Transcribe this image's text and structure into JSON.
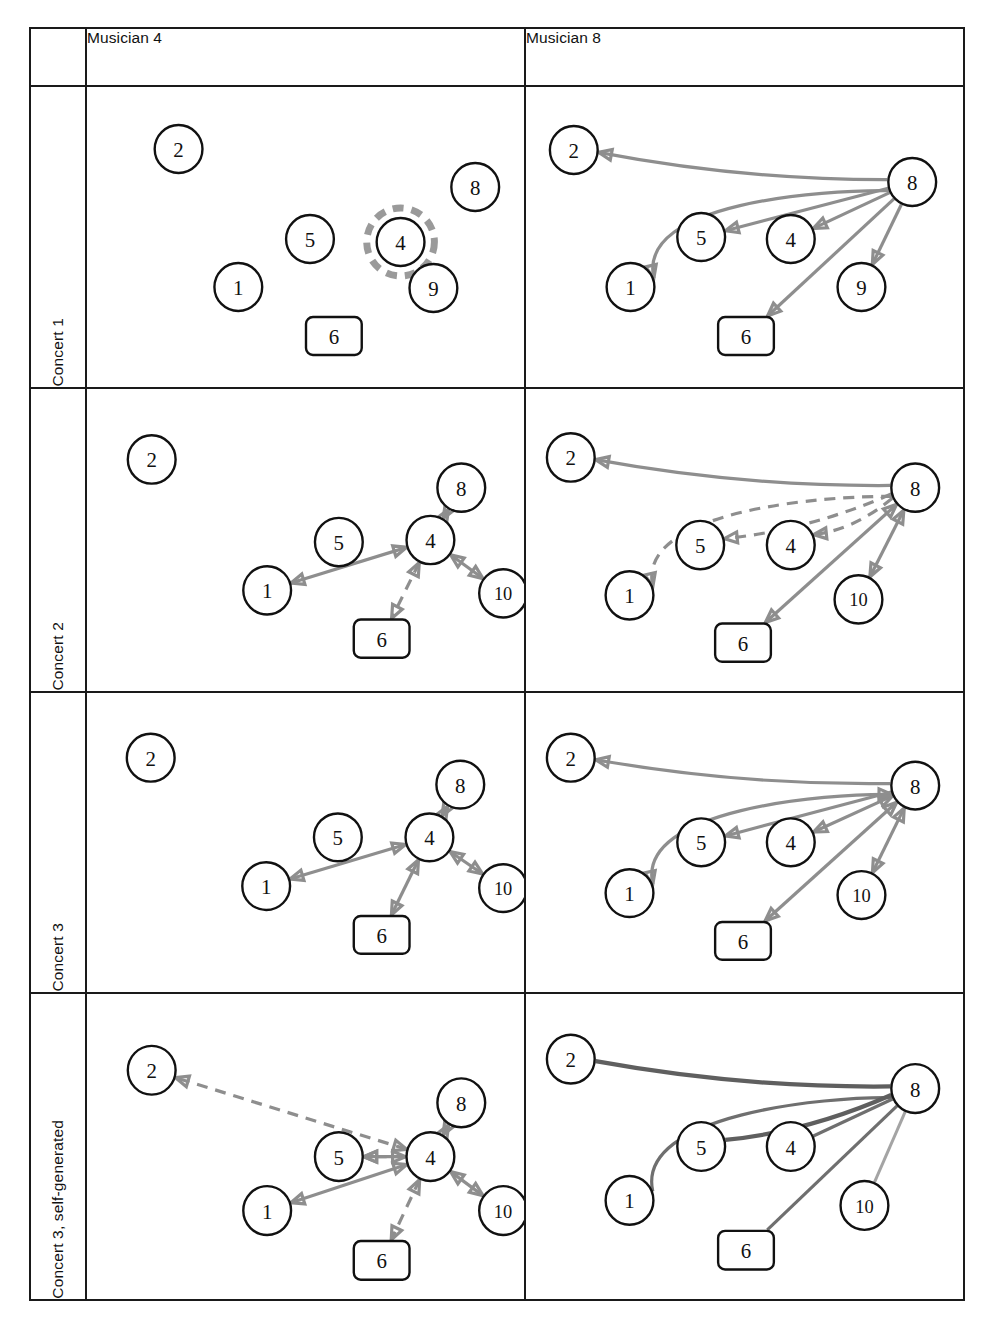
{
  "figure": {
    "columns": [
      {
        "id": "musician4",
        "label": "Musician 4"
      },
      {
        "id": "musician8",
        "label": "Musician 8"
      }
    ],
    "rows": [
      {
        "id": "concert1",
        "label": "Concert 1"
      },
      {
        "id": "concert2",
        "label": "Concert 2"
      },
      {
        "id": "concert3",
        "label": "Concert 3"
      },
      {
        "id": "concert3sg",
        "label": "Concert 3, self-generated"
      }
    ],
    "corner_label": "",
    "colors": {
      "border": "#1a1a1a",
      "node_stroke": "#111111",
      "node_fill": "#ffffff",
      "edge": "#8e8e8e",
      "edge_dark": "#5f5f5f",
      "highlight_ring": "#9a9a9a",
      "background": "#ffffff"
    }
  },
  "chart_data": {
    "type": "diagram",
    "subtype": "directed-graph-matrix",
    "grid": {
      "rows": 4,
      "columns": 2
    },
    "node_shapes": {
      "circle": "musician",
      "rounded-rect": "musician-6"
    },
    "edge_styles": {
      "solid": "observed / realised interaction",
      "dashed": "alternate / secondary interaction",
      "arrow-single": "one-directional",
      "arrow-double": "bi-directional",
      "no-arrow": "undirected link"
    },
    "panels": [
      {
        "row": "Concert 1",
        "column": "Musician 4",
        "focus_node": "4",
        "focus_highlighted": true,
        "nodes": [
          {
            "id": "2",
            "label": "2",
            "shape": "circle",
            "x": 92,
            "y": 62
          },
          {
            "id": "8",
            "label": "8",
            "shape": "circle",
            "x": 390,
            "y": 100
          },
          {
            "id": "5",
            "label": "5",
            "shape": "circle",
            "x": 224,
            "y": 152
          },
          {
            "id": "4",
            "label": "4",
            "shape": "circle",
            "x": 315,
            "y": 155
          },
          {
            "id": "1",
            "label": "1",
            "shape": "circle",
            "x": 152,
            "y": 200
          },
          {
            "id": "9",
            "label": "9",
            "shape": "circle",
            "x": 348,
            "y": 201
          },
          {
            "id": "6",
            "label": "6",
            "shape": "rect",
            "x": 248,
            "y": 249
          }
        ],
        "edges": []
      },
      {
        "row": "Concert 1",
        "column": "Musician 8",
        "focus_node": "8",
        "focus_highlighted": false,
        "nodes": [
          {
            "id": "2",
            "label": "2",
            "shape": "circle",
            "x": 48,
            "y": 63
          },
          {
            "id": "8",
            "label": "8",
            "shape": "circle",
            "x": 388,
            "y": 95
          },
          {
            "id": "5",
            "label": "5",
            "shape": "circle",
            "x": 176,
            "y": 150
          },
          {
            "id": "4",
            "label": "4",
            "shape": "circle",
            "x": 266,
            "y": 152
          },
          {
            "id": "1",
            "label": "1",
            "shape": "circle",
            "x": 105,
            "y": 200
          },
          {
            "id": "9",
            "label": "9",
            "shape": "circle",
            "x": 337,
            "y": 200
          },
          {
            "id": "6",
            "label": "6",
            "shape": "rect",
            "x": 221,
            "y": 249
          }
        ],
        "edges": [
          {
            "from": "8",
            "to": "2",
            "style": "solid",
            "direction": "single",
            "curve": "slight"
          },
          {
            "from": "8",
            "to": "1",
            "style": "solid",
            "direction": "single",
            "curve": "strong"
          },
          {
            "from": "8",
            "to": "5",
            "style": "solid",
            "direction": "single",
            "curve": "none"
          },
          {
            "from": "8",
            "to": "4",
            "style": "solid",
            "direction": "single",
            "curve": "none"
          },
          {
            "from": "8",
            "to": "6",
            "style": "solid",
            "direction": "single",
            "curve": "none"
          },
          {
            "from": "8",
            "to": "9",
            "style": "solid",
            "direction": "single",
            "curve": "none"
          }
        ]
      },
      {
        "row": "Concert 2",
        "column": "Musician 4",
        "focus_node": "4",
        "focus_highlighted": false,
        "nodes": [
          {
            "id": "2",
            "label": "2",
            "shape": "circle",
            "x": 65,
            "y": 70
          },
          {
            "id": "8",
            "label": "8",
            "shape": "circle",
            "x": 376,
            "y": 98
          },
          {
            "id": "5",
            "label": "5",
            "shape": "circle",
            "x": 253,
            "y": 152
          },
          {
            "id": "4",
            "label": "4",
            "shape": "circle",
            "x": 345,
            "y": 150
          },
          {
            "id": "1",
            "label": "1",
            "shape": "circle",
            "x": 181,
            "y": 200
          },
          {
            "id": "10",
            "label": "10",
            "shape": "circle",
            "x": 418,
            "y": 203
          },
          {
            "id": "6",
            "label": "6",
            "shape": "rect",
            "x": 296,
            "y": 248
          }
        ],
        "edges": [
          {
            "from": "4",
            "to": "1",
            "style": "solid",
            "direction": "double",
            "curve": "none"
          },
          {
            "from": "4",
            "to": "8",
            "style": "solid",
            "direction": "double",
            "curve": "none"
          },
          {
            "from": "4",
            "to": "10",
            "style": "solid",
            "direction": "double",
            "curve": "none"
          },
          {
            "from": "4",
            "to": "6",
            "style": "dashed",
            "direction": "double",
            "curve": "none"
          }
        ]
      },
      {
        "row": "Concert 2",
        "column": "Musician 8",
        "focus_node": "8",
        "focus_highlighted": false,
        "nodes": [
          {
            "id": "2",
            "label": "2",
            "shape": "circle",
            "x": 45,
            "y": 68
          },
          {
            "id": "8",
            "label": "8",
            "shape": "circle",
            "x": 391,
            "y": 98
          },
          {
            "id": "5",
            "label": "5",
            "shape": "circle",
            "x": 175,
            "y": 155
          },
          {
            "id": "4",
            "label": "4",
            "shape": "circle",
            "x": 266,
            "y": 155
          },
          {
            "id": "1",
            "label": "1",
            "shape": "circle",
            "x": 104,
            "y": 205
          },
          {
            "id": "10",
            "label": "10",
            "shape": "circle",
            "x": 334,
            "y": 209
          },
          {
            "id": "6",
            "label": "6",
            "shape": "rect",
            "x": 218,
            "y": 252
          }
        ],
        "edges": [
          {
            "from": "8",
            "to": "2",
            "style": "solid",
            "direction": "single",
            "curve": "slight"
          },
          {
            "from": "8",
            "to": "1",
            "style": "dashed",
            "direction": "single",
            "curve": "strong"
          },
          {
            "from": "8",
            "to": "5",
            "style": "dashed",
            "direction": "single",
            "curve": "slight"
          },
          {
            "from": "8",
            "to": "4",
            "style": "dashed",
            "direction": "single",
            "curve": "slight"
          },
          {
            "from": "8",
            "to": "6",
            "style": "solid",
            "direction": "double",
            "curve": "none"
          },
          {
            "from": "8",
            "to": "10",
            "style": "solid",
            "direction": "double",
            "curve": "none"
          }
        ]
      },
      {
        "row": "Concert 3",
        "column": "Musician 4",
        "focus_node": "4",
        "focus_highlighted": false,
        "nodes": [
          {
            "id": "2",
            "label": "2",
            "shape": "circle",
            "x": 64,
            "y": 65
          },
          {
            "id": "8",
            "label": "8",
            "shape": "circle",
            "x": 375,
            "y": 92
          },
          {
            "id": "5",
            "label": "5",
            "shape": "circle",
            "x": 252,
            "y": 145
          },
          {
            "id": "4",
            "label": "4",
            "shape": "circle",
            "x": 344,
            "y": 145
          },
          {
            "id": "1",
            "label": "1",
            "shape": "circle",
            "x": 180,
            "y": 194
          },
          {
            "id": "10",
            "label": "10",
            "shape": "circle",
            "x": 418,
            "y": 196
          },
          {
            "id": "6",
            "label": "6",
            "shape": "rect",
            "x": 296,
            "y": 243
          }
        ],
        "edges": [
          {
            "from": "4",
            "to": "1",
            "style": "solid",
            "direction": "double",
            "curve": "none"
          },
          {
            "from": "4",
            "to": "8",
            "style": "solid",
            "direction": "double",
            "curve": "none"
          },
          {
            "from": "4",
            "to": "10",
            "style": "solid",
            "direction": "double",
            "curve": "none"
          },
          {
            "from": "4",
            "to": "6",
            "style": "solid",
            "direction": "double",
            "curve": "none"
          }
        ]
      },
      {
        "row": "Concert 3",
        "column": "Musician 8",
        "focus_node": "8",
        "focus_highlighted": false,
        "nodes": [
          {
            "id": "2",
            "label": "2",
            "shape": "circle",
            "x": 45,
            "y": 65
          },
          {
            "id": "8",
            "label": "8",
            "shape": "circle",
            "x": 391,
            "y": 93
          },
          {
            "id": "5",
            "label": "5",
            "shape": "circle",
            "x": 176,
            "y": 150
          },
          {
            "id": "4",
            "label": "4",
            "shape": "circle",
            "x": 266,
            "y": 150
          },
          {
            "id": "1",
            "label": "1",
            "shape": "circle",
            "x": 104,
            "y": 201
          },
          {
            "id": "10",
            "label": "10",
            "shape": "circle",
            "x": 337,
            "y": 203
          },
          {
            "id": "6",
            "label": "6",
            "shape": "rect",
            "x": 218,
            "y": 249
          }
        ],
        "edges": [
          {
            "from": "8",
            "to": "2",
            "style": "solid",
            "direction": "single",
            "curve": "slight"
          },
          {
            "from": "8",
            "to": "1",
            "style": "solid",
            "direction": "double",
            "curve": "strong"
          },
          {
            "from": "8",
            "to": "5",
            "style": "solid",
            "direction": "single",
            "curve": "none"
          },
          {
            "from": "8",
            "to": "4",
            "style": "solid",
            "direction": "double",
            "curve": "none"
          },
          {
            "from": "8",
            "to": "6",
            "style": "solid",
            "direction": "double",
            "curve": "none"
          },
          {
            "from": "8",
            "to": "10",
            "style": "solid",
            "direction": "double",
            "curve": "none"
          }
        ]
      },
      {
        "row": "Concert 3, self-generated",
        "column": "Musician 4",
        "focus_node": "4",
        "focus_highlighted": false,
        "nodes": [
          {
            "id": "2",
            "label": "2",
            "shape": "circle",
            "x": 65,
            "y": 75
          },
          {
            "id": "8",
            "label": "8",
            "shape": "circle",
            "x": 376,
            "y": 107
          },
          {
            "id": "5",
            "label": "5",
            "shape": "circle",
            "x": 253,
            "y": 160
          },
          {
            "id": "4",
            "label": "4",
            "shape": "circle",
            "x": 345,
            "y": 160
          },
          {
            "id": "1",
            "label": "1",
            "shape": "circle",
            "x": 181,
            "y": 213
          },
          {
            "id": "10",
            "label": "10",
            "shape": "circle",
            "x": 418,
            "y": 213
          },
          {
            "id": "6",
            "label": "6",
            "shape": "rect",
            "x": 296,
            "y": 262
          }
        ],
        "edges": [
          {
            "from": "4",
            "to": "2",
            "style": "dashed",
            "direction": "double",
            "curve": "none"
          },
          {
            "from": "4",
            "to": "5",
            "style": "dashed",
            "direction": "single",
            "curve": "none"
          },
          {
            "from": "4",
            "to": "5",
            "style": "solid",
            "direction": "double",
            "curve": "none"
          },
          {
            "from": "4",
            "to": "1",
            "style": "solid",
            "direction": "double",
            "curve": "none"
          },
          {
            "from": "4",
            "to": "8",
            "style": "solid",
            "direction": "double",
            "curve": "none"
          },
          {
            "from": "4",
            "to": "10",
            "style": "solid",
            "direction": "double",
            "curve": "none"
          },
          {
            "from": "4",
            "to": "6",
            "style": "dashed",
            "direction": "double",
            "curve": "none"
          }
        ]
      },
      {
        "row": "Concert 3, self-generated",
        "column": "Musician 8",
        "focus_node": "8",
        "focus_highlighted": false,
        "nodes": [
          {
            "id": "2",
            "label": "2",
            "shape": "circle",
            "x": 45,
            "y": 64
          },
          {
            "id": "8",
            "label": "8",
            "shape": "circle",
            "x": 391,
            "y": 93
          },
          {
            "id": "5",
            "label": "5",
            "shape": "circle",
            "x": 176,
            "y": 150
          },
          {
            "id": "4",
            "label": "4",
            "shape": "circle",
            "x": 266,
            "y": 150
          },
          {
            "id": "1",
            "label": "1",
            "shape": "circle",
            "x": 104,
            "y": 203
          },
          {
            "id": "10",
            "label": "10",
            "shape": "circle",
            "x": 340,
            "y": 208
          },
          {
            "id": "6",
            "label": "6",
            "shape": "rect",
            "x": 221,
            "y": 252
          }
        ],
        "edges": [
          {
            "from": "8",
            "to": "2",
            "style": "solid",
            "direction": "none",
            "curve": "slight",
            "weight": "heavy"
          },
          {
            "from": "8",
            "to": "1",
            "style": "solid",
            "direction": "none",
            "curve": "strong",
            "weight": "medium"
          },
          {
            "from": "8",
            "to": "5",
            "style": "solid",
            "direction": "none",
            "curve": "slight",
            "weight": "heavy"
          },
          {
            "from": "8",
            "to": "4",
            "style": "solid",
            "direction": "none",
            "curve": "none",
            "weight": "medium"
          },
          {
            "from": "8",
            "to": "6",
            "style": "solid",
            "direction": "none",
            "curve": "none",
            "weight": "medium"
          },
          {
            "from": "8",
            "to": "10",
            "style": "solid",
            "direction": "none",
            "curve": "none",
            "weight": "light"
          }
        ]
      }
    ]
  }
}
